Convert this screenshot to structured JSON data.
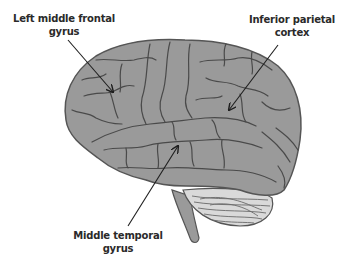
{
  "diagram": {
    "colors": {
      "cortex_fill": "#9a9a9a",
      "sulcus_stroke": "#4a4a4a",
      "outline": "#555555",
      "cerebellum_fill": "#d9d9d9",
      "arrow": "#1e1e1e",
      "label_text": "#2a2a2a",
      "background": "#ffffff"
    },
    "labels": [
      {
        "id": "frontal",
        "line1": "Left middle frontal",
        "line2": "gyrus",
        "x": 64,
        "y": 12,
        "arrow_from": [
          68,
          40
        ],
        "arrow_to": [
          113,
          92
        ]
      },
      {
        "id": "parietal",
        "line1": "Inferior parietal",
        "line2": "cortex",
        "x": 292,
        "y": 13,
        "arrow_from": [
          278,
          45
        ],
        "arrow_to": [
          229,
          110
        ]
      },
      {
        "id": "temporal",
        "line1": "Middle temporal",
        "line2": "gyrus",
        "x": 118,
        "y": 229,
        "arrow_from": [
          128,
          226
        ],
        "arrow_to": [
          178,
          146
        ]
      }
    ]
  }
}
